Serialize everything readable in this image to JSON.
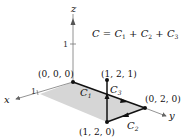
{
  "figure": {
    "equation": {
      "lhs": "C",
      "equals": "=",
      "terms": [
        {
          "symbol": "C",
          "sub": "1"
        },
        {
          "symbol": "C",
          "sub": "2"
        },
        {
          "symbol": "C",
          "sub": "3"
        }
      ],
      "plus": "+"
    },
    "axes": {
      "x": {
        "label": "x",
        "tick": "1"
      },
      "y": {
        "label": "y"
      },
      "z": {
        "label": "z",
        "tick": "1"
      }
    },
    "points": [
      {
        "label": "(0, 0, 0)"
      },
      {
        "label": "(1, 2, 1)"
      },
      {
        "label": "(0, 2, 0)"
      },
      {
        "label": "(1, 2, 0)"
      }
    ],
    "curves": [
      {
        "symbol": "C",
        "sub": "1"
      },
      {
        "symbol": "C",
        "sub": "2"
      },
      {
        "symbol": "C",
        "sub": "3"
      }
    ],
    "colors": {
      "shade": "#d4d4d4",
      "axis": "#777777",
      "path": "#111111"
    }
  }
}
